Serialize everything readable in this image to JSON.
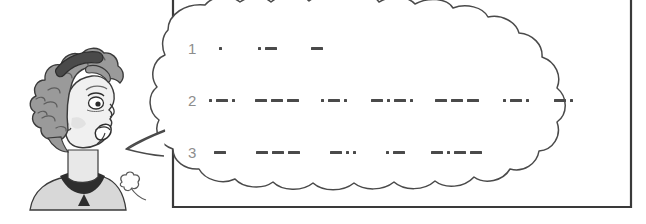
{
  "scene": {
    "title": "Morse code speech bubble cartoon",
    "background_color": "#ffffff",
    "frame_color": "#3a3a3a",
    "cloud_outline_color": "#4a4a4a",
    "cloud_fill_color": "#ffffff",
    "number_color": "#8d8d8d",
    "morse_color": "#4a4a4a",
    "hair_color": "#9a9a9a",
    "skin_color": "#e8e8e8",
    "shadow_color": "#c9c9c9",
    "dark_color": "#2e2e2e"
  },
  "character": {
    "name": "woman-speaking",
    "description": "Cartoon woman head in profile facing right with curly hair, headband, open mouth"
  },
  "bubble": {
    "name": "speech-bubble",
    "tail": "puff-trail",
    "small_puff": "small-puff"
  },
  "morse": {
    "rows": [
      {
        "number": "1",
        "groups": [
          {
            "symbols": [
              "dot"
            ]
          },
          {
            "symbols": [
              "dot",
              "dash"
            ]
          },
          {
            "symbols": [
              "dash"
            ]
          }
        ]
      },
      {
        "number": "2",
        "groups": [
          {
            "symbols": [
              "dot",
              "dash",
              "dot"
            ]
          },
          {
            "symbols": [
              "dash",
              "dash",
              "dash"
            ]
          },
          {
            "symbols": [
              "dot",
              "dash",
              "dot"
            ]
          },
          {
            "symbols": [
              "dash",
              "dot",
              "dash",
              "dot"
            ]
          },
          {
            "symbols": [
              "dash",
              "dash",
              "dash"
            ]
          },
          {
            "symbols": [
              "dot",
              "dash",
              "dot"
            ]
          },
          {
            "symbols": [
              "dash",
              "dot"
            ]
          }
        ]
      },
      {
        "number": "3",
        "groups": [
          {
            "symbols": [
              "dash"
            ]
          },
          {
            "symbols": [
              "dash",
              "dash",
              "dash"
            ]
          },
          {
            "symbols": [
              "dash",
              "dot",
              "dot"
            ]
          },
          {
            "symbols": [
              "dot",
              "dash"
            ]
          },
          {
            "symbols": [
              "dash",
              "dot",
              "dash",
              "dash"
            ]
          }
        ]
      }
    ]
  }
}
